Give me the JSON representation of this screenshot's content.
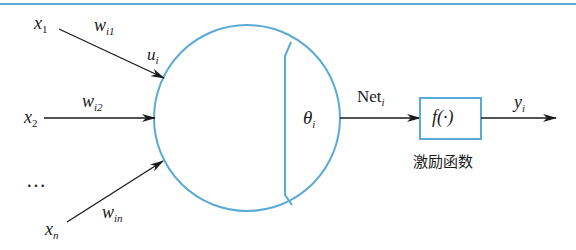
{
  "diagram": {
    "colors": {
      "accent": "#5aaad6",
      "line": "#1a1a1a",
      "background": "#ffffff"
    },
    "inputs": [
      {
        "var": "x",
        "sub": "1",
        "weight_var": "w",
        "weight_sub": "i1"
      },
      {
        "var": "x",
        "sub": "2",
        "weight_var": "w",
        "weight_sub": "i2"
      },
      {
        "var": "x",
        "sub": "n",
        "weight_var": "w",
        "weight_sub": "in"
      }
    ],
    "ellipsis": "…",
    "sum_label": {
      "var": "u",
      "sub": "i"
    },
    "threshold": {
      "var": "θ",
      "sub": "i"
    },
    "net": {
      "text": "Net",
      "sub": "i"
    },
    "activation": {
      "text": "f(·)",
      "caption": "激励函数"
    },
    "output": {
      "var": "y",
      "sub": "i"
    }
  }
}
